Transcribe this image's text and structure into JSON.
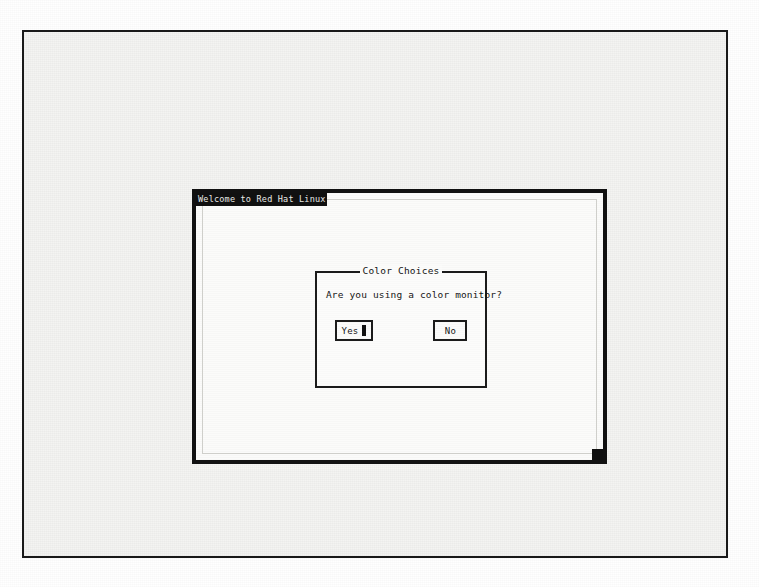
{
  "screen": {
    "terminal": {
      "title": "Welcome to Red Hat Linux",
      "corner_marker_name": "resize-corner-marker"
    },
    "dialog": {
      "caption": "Color Choices",
      "caption_dash_left": "—",
      "caption_dash_right": "—",
      "prompt": "Are you using a color monitor?",
      "buttons": [
        {
          "label": "Yes",
          "focused": true
        },
        {
          "label": "No",
          "focused": false
        }
      ]
    }
  },
  "colors": {
    "ink": "#141414",
    "paper": "#fcfcfb",
    "titlebar_bg": "#101010",
    "titlebar_fg": "#e9e9e6",
    "frame": "#1a1a1a"
  }
}
